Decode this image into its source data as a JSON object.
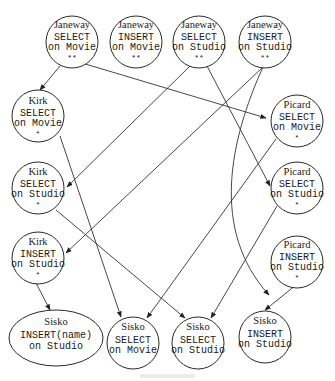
{
  "diagram": {
    "type": "directed-graph",
    "nodes": [
      {
        "id": "n1",
        "user": "Janeway",
        "op": "SELECT",
        "target": "on Movie",
        "stars": "**"
      },
      {
        "id": "n2",
        "user": "Janeway",
        "op": "INSERT",
        "target": "on Movie",
        "stars": "**"
      },
      {
        "id": "n3",
        "user": "Janeway",
        "op": "SELECT",
        "target": "on Studio",
        "stars": "**"
      },
      {
        "id": "n4",
        "user": "Janeway",
        "op": "INSERT",
        "target": "on Studio",
        "stars": "**"
      },
      {
        "id": "n5",
        "user": "Kirk",
        "op": "SELECT",
        "target": "on Movie",
        "stars": "*"
      },
      {
        "id": "n6",
        "user": "Kirk",
        "op": "SELECT",
        "target": "on Studio",
        "stars": "*"
      },
      {
        "id": "n7",
        "user": "Kirk",
        "op": "INSERT",
        "target": "on Studio",
        "stars": "*"
      },
      {
        "id": "n8",
        "user": "Picard",
        "op": "SELECT",
        "target": "on Movie",
        "stars": "*"
      },
      {
        "id": "n9",
        "user": "Picard",
        "op": "SELECT",
        "target": "on Studio",
        "stars": "*"
      },
      {
        "id": "n10",
        "user": "Picard",
        "op": "INSERT",
        "target": "on Studio",
        "stars": "*"
      },
      {
        "id": "n11",
        "user": "Sisko",
        "op": "INSERT(name)",
        "target": "on Studio",
        "stars": ""
      },
      {
        "id": "n12",
        "user": "Sisko",
        "op": "SELECT",
        "target": "on Movie",
        "stars": ""
      },
      {
        "id": "n13",
        "user": "Sisko",
        "op": "SELECT",
        "target": "on Studio",
        "stars": ""
      },
      {
        "id": "n14",
        "user": "Sisko",
        "op": "INSERT",
        "target": "on Studio",
        "stars": ""
      }
    ],
    "edges": [
      {
        "from": "n1",
        "to": "n5"
      },
      {
        "from": "n1",
        "to": "n8"
      },
      {
        "from": "n3",
        "to": "n6"
      },
      {
        "from": "n3",
        "to": "n9"
      },
      {
        "from": "n4",
        "to": "n7"
      },
      {
        "from": "n4",
        "to": "n10"
      },
      {
        "from": "n5",
        "to": "n12"
      },
      {
        "from": "n6",
        "to": "n13"
      },
      {
        "from": "n7",
        "to": "n11"
      },
      {
        "from": "n8",
        "to": "n12"
      },
      {
        "from": "n9",
        "to": "n13"
      },
      {
        "from": "n10",
        "to": "n14"
      }
    ],
    "colors": {
      "stroke": "#2a2a2a",
      "background": "#ffffff"
    }
  }
}
